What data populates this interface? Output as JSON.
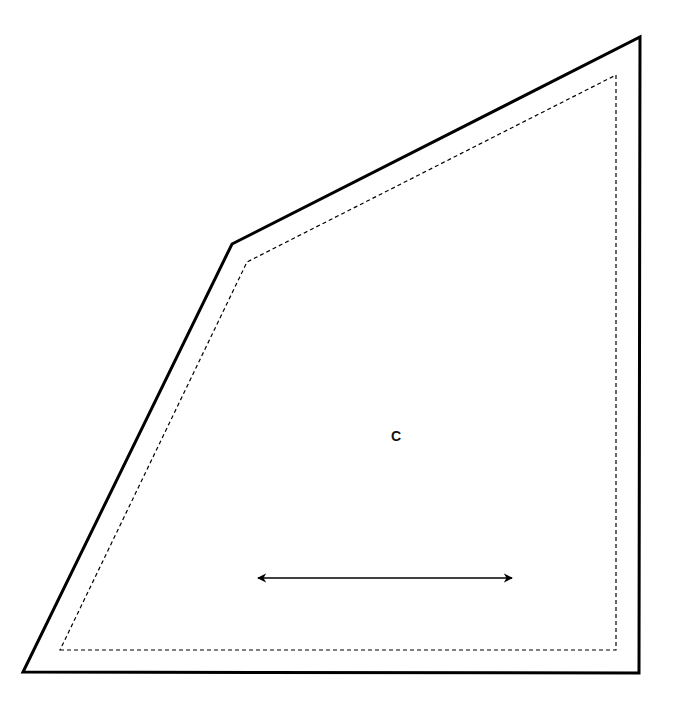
{
  "diagram": {
    "type": "pattern-piece",
    "piece_label": "C",
    "grainline": "horizontal double-headed arrow",
    "colors": {
      "stroke": "#000000",
      "background": "#ffffff"
    },
    "outer_cut_line": [
      [
        23,
        672
      ],
      [
        639,
        673
      ],
      [
        640,
        37
      ],
      [
        232,
        244
      ]
    ],
    "inner_seam_line": [
      [
        60,
        650
      ],
      [
        616,
        650
      ],
      [
        616,
        75
      ],
      [
        247,
        262
      ]
    ],
    "arrow": {
      "x1": 256,
      "y1": 578,
      "x2": 514,
      "y2": 578
    }
  }
}
